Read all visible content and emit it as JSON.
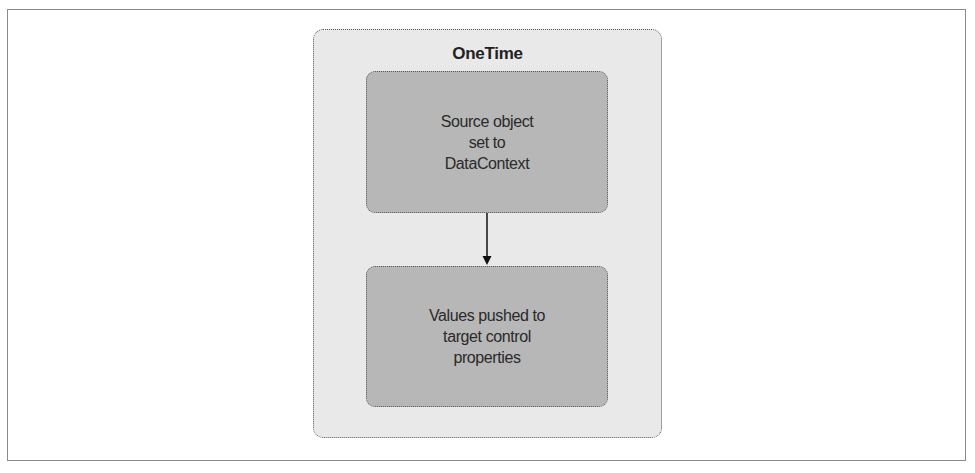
{
  "diagram": {
    "container_title": "OneTime",
    "nodes": [
      {
        "id": "source",
        "label": "Source object\nset to\nDataContext"
      },
      {
        "id": "target",
        "label": "Values pushed to\ntarget control\nproperties"
      }
    ],
    "edges": [
      {
        "from": "source",
        "to": "target",
        "style": "arrow"
      }
    ],
    "colors": {
      "container_fill": "#e9e9e9",
      "node_fill": "#b7b7b7",
      "border": "#5a5a5a",
      "text": "#222222"
    }
  }
}
